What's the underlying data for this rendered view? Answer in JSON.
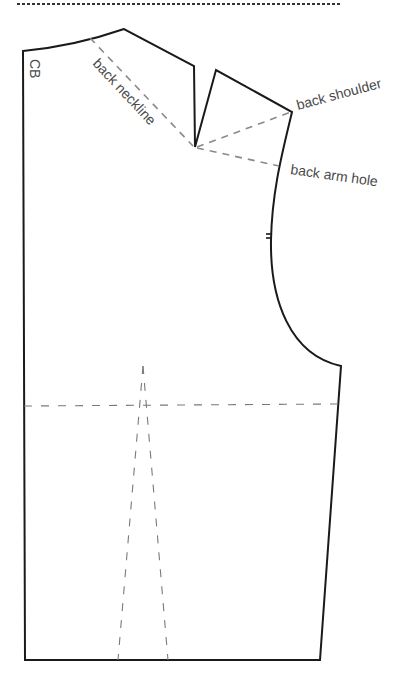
{
  "diagram": {
    "labels": {
      "center_back": "CB",
      "back_neckline": "back neckline",
      "back_shoulder": "back shoulder",
      "back_arm_hole": "back arm hole"
    },
    "colors": {
      "outline": "#1a1a1a",
      "guide": "#8a8a8a",
      "label": "#4a4a4a",
      "background": "#ffffff"
    }
  }
}
